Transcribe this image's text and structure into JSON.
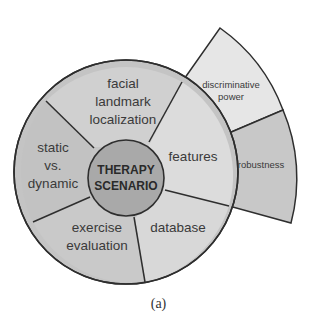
{
  "diagram": {
    "center": {
      "line1": "THERAPY",
      "line2": "SCENARIO"
    },
    "segments": [
      {
        "id": "facial-landmark-localization",
        "lines": [
          "facial",
          "landmark",
          "localization"
        ]
      },
      {
        "id": "features",
        "lines": [
          "features"
        ]
      },
      {
        "id": "database",
        "lines": [
          "database"
        ]
      },
      {
        "id": "exercise-evaluation",
        "lines": [
          "exercise",
          "evaluation"
        ]
      },
      {
        "id": "static-vs-dynamic",
        "lines": [
          "static",
          "vs.",
          "dynamic"
        ]
      }
    ],
    "outer_segments": [
      {
        "id": "discriminative-power",
        "lines": [
          "discriminative",
          "power"
        ]
      },
      {
        "id": "robustness",
        "lines": [
          "robustness"
        ]
      }
    ],
    "colors": {
      "center_fill": "#a9a9a9",
      "ring_dark": "#c4c4c4",
      "ring_light": "#dcdcdc",
      "outer_light": "#e6e6e6",
      "outer_dark": "#c8c8c8",
      "stroke": "#2e2e2e"
    }
  },
  "caption": "(a)"
}
